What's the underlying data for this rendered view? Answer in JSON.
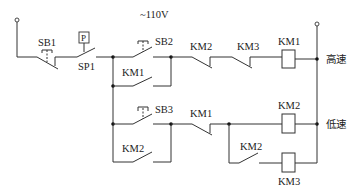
{
  "diagram": {
    "title": "~110V",
    "supply_voltage": "~110V",
    "components": {
      "sb1": "SB1",
      "sp1": "SP1",
      "pressure_box": "P",
      "sb2": "SB2",
      "km1_hold": "KM1",
      "km2_nc_top": "KM2",
      "km3_nc_top": "KM3",
      "km1_coil": "KM1",
      "sb3": "SB3",
      "km2_hold": "KM2",
      "km1_nc_bottom": "KM1",
      "km2_coil": "KM2",
      "km2_no_bottom": "KM2",
      "km3_coil": "KM3"
    },
    "outputs": {
      "high_speed": "高速",
      "low_speed": "低速"
    }
  }
}
